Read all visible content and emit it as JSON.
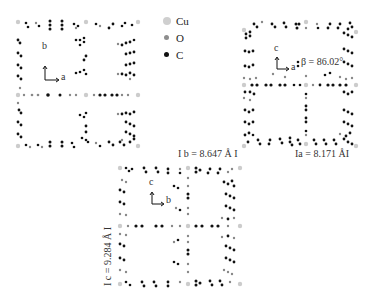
{
  "legend": {
    "items": [
      {
        "label": "Cu",
        "color": "#cfcfcf",
        "size": 8
      },
      {
        "label": "O",
        "color": "#8e8e8e",
        "size": 5
      },
      {
        "label": "C",
        "color": "#111111",
        "size": 5
      }
    ]
  },
  "panel_ab": {
    "axis_vertical": "b",
    "axis_horizontal": "a"
  },
  "panel_ac": {
    "axis_vertical": "c",
    "axis_horizontal": "a",
    "beta_label": "β = 86.02°",
    "a_length_label": "Ia = 8.171 ÅI"
  },
  "panel_bc": {
    "axis_vertical": "c",
    "axis_horizontal": "b",
    "b_length_label": "I b = 8.647 Å I",
    "c_length_label": "I c = 9.284 Å I"
  }
}
